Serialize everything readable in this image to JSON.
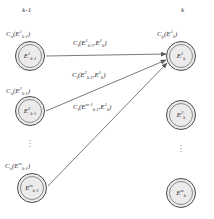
{
  "diagram": {
    "columns": {
      "left_header": "k-1",
      "right_header": "k"
    },
    "left_nodes": [
      {
        "id": "E1-km1",
        "base": "E",
        "sup": "1",
        "sub": "k-1",
        "cost_label": {
          "fn": "C",
          "fn_sub": "u",
          "open": "(",
          "base": "E",
          "sup": "1",
          "sub": "k-1",
          "close": ")"
        }
      },
      {
        "id": "E2-km1",
        "base": "E",
        "sup": "2",
        "sub": "k-1",
        "cost_label": {
          "fn": "C",
          "fn_sub": "u",
          "open": "(",
          "base": "E",
          "sup": "2",
          "sub": "k-1",
          "close": ")"
        }
      },
      {
        "id": "Em-km1",
        "base": "E",
        "sup": "m",
        "sub": "k-1",
        "cost_label": {
          "fn": "C",
          "fn_sub": "u",
          "open": "(",
          "base": "E",
          "sup": "m",
          "sub": "k-1",
          "close": ")"
        }
      }
    ],
    "right_nodes": [
      {
        "id": "E1-k",
        "base": "E",
        "sup": "1",
        "sub": "k",
        "cost_label": {
          "fn": "C",
          "fn_sub": "p",
          "open": "(",
          "base": "E",
          "sup": "1",
          "sub": "k",
          "close": ")"
        }
      },
      {
        "id": "E2-k",
        "base": "E",
        "sup": "2",
        "sub": "k",
        "cost_label": null
      },
      {
        "id": "Em-k",
        "base": "E",
        "sup": "m",
        "sub": "k",
        "cost_label": null
      }
    ],
    "edges": [
      {
        "from": "E1-km1",
        "to": "E1-k",
        "label": {
          "fn": "C",
          "fn_sub": "t",
          "open": "(",
          "a_base": "E",
          "a_sup": "1",
          "a_sub": "k-1",
          "comma": ",",
          "b_base": "E",
          "b_sup": "1",
          "b_sub": "k",
          "close": ")"
        }
      },
      {
        "from": "E2-km1",
        "to": "E1-k",
        "label": {
          "fn": "C",
          "fn_sub": "t",
          "open": "(",
          "a_base": "E",
          "a_sup": "2",
          "a_sub": "k-1",
          "comma": ",",
          "b_base": "E",
          "b_sup": "1",
          "b_sub": "k",
          "close": ")"
        }
      },
      {
        "from": "Em-km1",
        "to": "E1-k",
        "label": {
          "fn": "C",
          "fn_sub": "t",
          "open": "(",
          "a_base": "E",
          "a_sup": "m-1",
          "a_sub": "k-1",
          "comma": ",",
          "b_base": "E",
          "b_sup": "1",
          "b_sub": "k",
          "close": ")"
        }
      }
    ],
    "ellipsis_glyph": "·",
    "colors": {
      "node_fill": "#eceaea",
      "node_stroke": "#4a4a4a",
      "edge_stroke": "#6b6b6b",
      "text": "#2b2b2b"
    }
  }
}
